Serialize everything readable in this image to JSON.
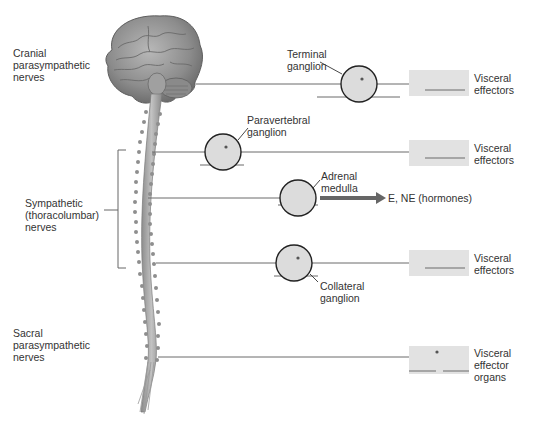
{
  "diagram": {
    "left_labels": {
      "cranial": "Cranial\nparasympathetic\nnerves",
      "sympathetic": "Sympathetic\n(thoracolumbar)\nnerves",
      "sacral": "Sacral\nparasympathetic\nnerves"
    },
    "ganglia": {
      "terminal": "Terminal\nganglion",
      "paravertebral": "Paravertebral\nganglion",
      "adrenal": "Adrenal\nmedulla",
      "collateral": "Collateral\nganglion"
    },
    "targets": {
      "row1": "Visceral\neffectors",
      "row2": "Visceral\neffectors",
      "row3": "E, NE (hormones)",
      "row4": "Visceral\neffectors",
      "row5": "Visceral\neffector\norgans"
    },
    "colors": {
      "ganglion_fill": "#dcdcdc",
      "effector_box": "#e2e2e2",
      "nerve_line": "#6a6a6a",
      "arrow": "#666666",
      "brain": "#9a9a9a",
      "spinal_cord": "#a8a8a8"
    }
  }
}
